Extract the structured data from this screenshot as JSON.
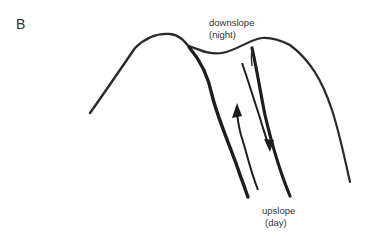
{
  "panel_label": "B",
  "labels": {
    "downslope": {
      "line1": "downslope",
      "line2": "(night)"
    },
    "upslope": {
      "line1": "upslope",
      "line2": "(day)"
    }
  },
  "arrows": [
    {
      "name": "upslope-arrow",
      "direction": "up"
    },
    {
      "name": "downslope-arrow",
      "direction": "down"
    }
  ]
}
